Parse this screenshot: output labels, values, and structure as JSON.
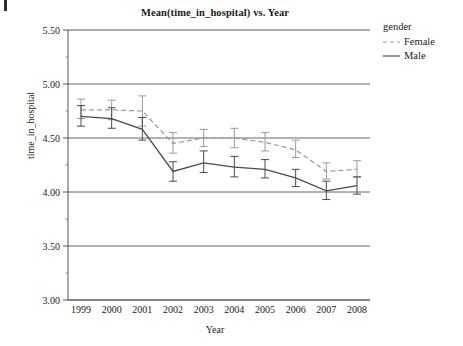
{
  "chart_data": {
    "type": "line",
    "title": "Mean(time_in_hospital) vs. Year",
    "xlabel": "Year",
    "ylabel": "time_in_hospital",
    "x": [
      1999,
      2000,
      2001,
      2002,
      2003,
      2004,
      2005,
      2006,
      2007,
      2008
    ],
    "categories": [
      "1999",
      "2000",
      "2001",
      "2002",
      "2003",
      "2004",
      "2005",
      "2006",
      "2007",
      "2008"
    ],
    "xtick_labels": [
      "1999",
      "2000",
      "2001",
      "2002",
      "2003",
      "2004",
      "2005",
      "2006",
      "2007",
      "2008"
    ],
    "ytick_labels": [
      "3.00",
      "3.50",
      "4.00",
      "4.50",
      "5.00",
      "5.50"
    ],
    "ytick_values": [
      3.0,
      3.5,
      4.0,
      4.5,
      5.0,
      5.5
    ],
    "yminor_values": [
      3.25,
      3.75,
      4.25,
      4.75,
      5.25
    ],
    "ylim": [
      3.0,
      5.5
    ],
    "grid": "horizontal-major",
    "legend_title": "gender",
    "legend_position": "right",
    "error_bars": "vertical caps (95% CI)",
    "series": [
      {
        "name": "Female",
        "color": "#9a9a9a",
        "style": "dashed",
        "values": [
          4.76,
          4.76,
          4.75,
          4.45,
          4.5,
          4.5,
          4.46,
          4.39,
          4.19,
          4.21
        ],
        "err_low": [
          4.68,
          4.67,
          4.61,
          4.36,
          4.42,
          4.41,
          4.38,
          4.32,
          4.12,
          4.14
        ],
        "err_high": [
          4.86,
          4.85,
          4.89,
          4.55,
          4.58,
          4.59,
          4.55,
          4.48,
          4.27,
          4.29
        ]
      },
      {
        "name": "Male",
        "color": "#4a4a4a",
        "style": "solid",
        "values": [
          4.7,
          4.68,
          4.58,
          4.19,
          4.27,
          4.23,
          4.21,
          4.13,
          4.01,
          4.06
        ],
        "err_low": [
          4.61,
          4.59,
          4.48,
          4.1,
          4.18,
          4.14,
          4.13,
          4.05,
          3.93,
          3.98
        ],
        "err_high": [
          4.8,
          4.78,
          4.69,
          4.28,
          4.38,
          4.33,
          4.3,
          4.21,
          4.1,
          4.14
        ]
      }
    ]
  },
  "legend": {
    "title": "gender",
    "items": [
      {
        "label": "Female"
      },
      {
        "label": "Male"
      }
    ]
  },
  "colors": {
    "female": "#9a9a9a",
    "male": "#4a4a4a",
    "axis": "#555555",
    "grid": "#555555",
    "text": "#1a1a1a"
  }
}
